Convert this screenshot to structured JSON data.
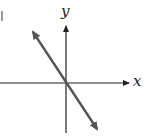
{
  "diagram": {
    "type": "coordinate-plane-graph",
    "axes": {
      "x_label": "x",
      "y_label": "y"
    },
    "line": {
      "description": "straight line through the origin with negative slope, arrows on both ends",
      "slope_sign": "negative",
      "passes_through_origin": true
    },
    "colors": {
      "axes": "#222222",
      "line": "#555555",
      "background": "#ffffff"
    }
  }
}
